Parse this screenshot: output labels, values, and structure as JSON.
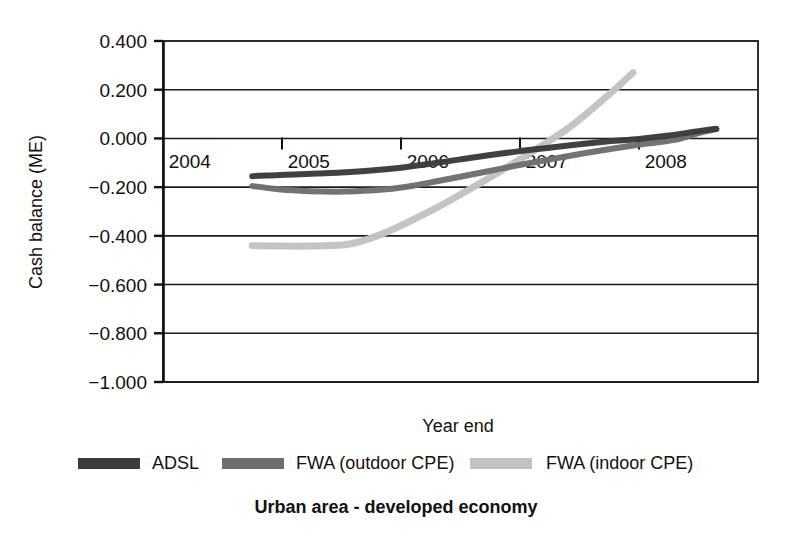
{
  "chart_data": {
    "type": "line",
    "title": "Urban area - developed economy",
    "xlabel": "Year end",
    "ylabel": "Cash balance (ME)",
    "grid": true,
    "legend_position": "bottom",
    "ylim": [
      -1.0,
      0.4
    ],
    "ytick_labels": [
      "0.400",
      "0.200",
      "0.000",
      "−0.200",
      "−0.400",
      "−0.600",
      "−0.800",
      "−1.000"
    ],
    "ytick_values": [
      0.4,
      0.2,
      0.0,
      -0.2,
      -0.4,
      -0.6,
      -0.8,
      -1.0
    ],
    "xtick_labels": [
      "2004",
      "2005",
      "2006",
      "2007",
      "2008"
    ],
    "xtick_values": [
      2004,
      2005,
      2006,
      2007,
      2008
    ],
    "xlim": [
      2003.5,
      2008.5
    ],
    "series": [
      {
        "name": "ADSL",
        "color": "#3b3b3b",
        "x": [
          2004.25,
          2004.4,
          2004.6,
          2004.8,
          2005.0,
          2005.25,
          2005.5,
          2005.75,
          2006.0,
          2006.25,
          2006.5,
          2006.75,
          2007.0,
          2007.25,
          2007.5,
          2007.75,
          2008.0,
          2008.15
        ],
        "values": [
          -0.155,
          -0.152,
          -0.148,
          -0.144,
          -0.14,
          -0.132,
          -0.12,
          -0.104,
          -0.086,
          -0.068,
          -0.052,
          -0.038,
          -0.024,
          -0.012,
          -0.002,
          0.012,
          0.03,
          0.04
        ]
      },
      {
        "name": "FWA (outdoor CPE)",
        "color": "#6e6e6e",
        "x": [
          2004.25,
          2004.45,
          2004.65,
          2004.85,
          2005.05,
          2005.3,
          2005.55,
          2005.8,
          2006.05,
          2006.3,
          2006.55,
          2006.8,
          2007.05,
          2007.3,
          2007.55,
          2007.8,
          2008.0,
          2008.15
        ],
        "values": [
          -0.195,
          -0.208,
          -0.215,
          -0.218,
          -0.218,
          -0.212,
          -0.198,
          -0.176,
          -0.152,
          -0.128,
          -0.104,
          -0.082,
          -0.06,
          -0.04,
          -0.022,
          -0.006,
          0.022,
          0.038
        ]
      },
      {
        "name": "FWA (indoor CPE)",
        "color": "#c2c2c2",
        "x": [
          2004.25,
          2004.5,
          2004.75,
          2005.0,
          2005.15,
          2005.4,
          2005.7,
          2006.0,
          2006.3,
          2006.6,
          2006.9,
          2007.2,
          2007.45
        ],
        "values": [
          -0.44,
          -0.442,
          -0.442,
          -0.438,
          -0.425,
          -0.38,
          -0.31,
          -0.23,
          -0.145,
          -0.055,
          0.04,
          0.16,
          0.27
        ]
      }
    ],
    "annotations": []
  },
  "axes": {
    "y_title": "Cash balance (ME)",
    "x_title": "Year end"
  },
  "legend": {
    "items": [
      {
        "label": "ADSL",
        "color": "#3b3b3b",
        "swatch_name": "legend-swatch-adsl"
      },
      {
        "label": "FWA (outdoor CPE)",
        "color": "#6e6e6e",
        "swatch_name": "legend-swatch-fwa-outdoor"
      },
      {
        "label": "FWA (indoor CPE)",
        "color": "#c2c2c2",
        "swatch_name": "legend-swatch-fwa-indoor"
      }
    ]
  },
  "title": {
    "text": "Urban area - developed economy"
  }
}
